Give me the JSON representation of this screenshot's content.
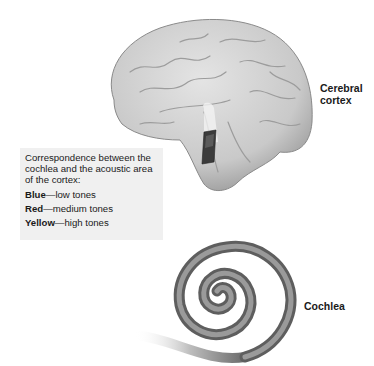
{
  "labels": {
    "cortex_line1": "Cerebral",
    "cortex_line2": "cortex",
    "cochlea": "Cochlea"
  },
  "legend": {
    "intro": "Correspondence between the cochlea and the acoustic area of the cortex:",
    "items": [
      {
        "key": "Blue",
        "sep": "—",
        "value": "low tones",
        "color": "#2255cc"
      },
      {
        "key": "Red",
        "sep": "—",
        "value": "medium tones",
        "color": "#cc2222"
      },
      {
        "key": "Yellow",
        "sep": "—",
        "value": "high tones",
        "color": "#e6c619"
      }
    ]
  },
  "illustrations": {
    "brain": "brain-lateral-view",
    "cochlea": "cochlea-spiral",
    "highlight": "acoustic-area-highlight"
  }
}
